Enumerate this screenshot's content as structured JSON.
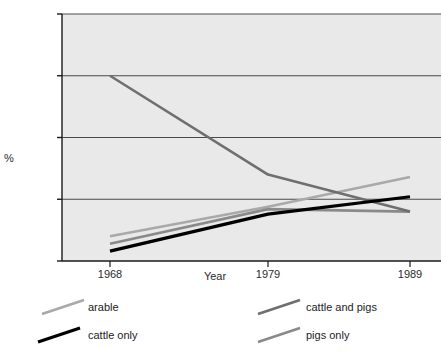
{
  "chart_data": {
    "type": "line",
    "title": "",
    "xlabel": "Year",
    "ylabel": "%",
    "x": [
      1968,
      1979,
      1989
    ],
    "xtick_labels": [
      "1968",
      "1979",
      "1989"
    ],
    "ytick_labels": [
      "0",
      "25",
      "50",
      "75",
      "100"
    ],
    "yticks": [
      0,
      25,
      50,
      75,
      100
    ],
    "ylim": [
      0,
      100
    ],
    "xlim": [
      1968,
      1989
    ],
    "grid": "horizontal",
    "legend_position": "below-plot",
    "series": [
      {
        "name": "arable",
        "values": [
          10,
          22,
          34
        ],
        "color": "#a9a9a9"
      },
      {
        "name": "cattle and pigs",
        "values": [
          75,
          35,
          20
        ],
        "color": "#6f6f6f"
      },
      {
        "name": "cattle only",
        "values": [
          4,
          19,
          26
        ],
        "color": "#000000"
      },
      {
        "name": "pigs only",
        "values": [
          7,
          21,
          20
        ],
        "color": "#8a8a8a"
      }
    ]
  },
  "legend": {
    "items": [
      {
        "label": "arable",
        "color": "#a9a9a9"
      },
      {
        "label": "cattle only",
        "color": "#000000"
      },
      {
        "label": "cattle and pigs",
        "color": "#6f6f6f"
      },
      {
        "label": "pigs only",
        "color": "#8a8a8a"
      }
    ]
  },
  "axes": {
    "y_title": "%",
    "x_title": "Year"
  },
  "colors": {
    "plot_background": "#e9e9e9",
    "axis": "#1a1a1a",
    "gridline": "#4a4a4a",
    "page_background": "#ffffff",
    "text": "#2b2b2b"
  }
}
